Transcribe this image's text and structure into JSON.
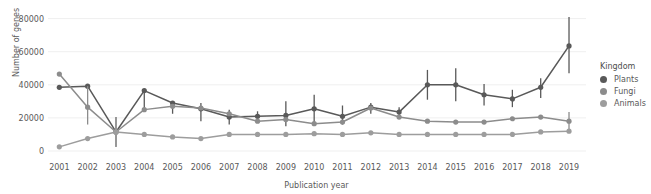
{
  "chart_data": {
    "type": "line",
    "title": "",
    "xlabel": "Publication year",
    "ylabel": "Number of genes",
    "x": [
      2001,
      2002,
      2003,
      2004,
      2005,
      2006,
      2007,
      2008,
      2009,
      2010,
      2011,
      2012,
      2013,
      2014,
      2015,
      2016,
      2017,
      2018,
      2019
    ],
    "xtick_labels": [
      "2001",
      "2002",
      "2003",
      "2004",
      "2005",
      "2006",
      "2007",
      "2008",
      "2009",
      "2010",
      "2011",
      "2012",
      "2013",
      "2014",
      "2015",
      "2016",
      "2017",
      "2018",
      "2019"
    ],
    "ytick_labels": [
      "0",
      "20000",
      "40000",
      "60000",
      "80000"
    ],
    "ytick_values": [
      0,
      20000,
      40000,
      60000,
      80000
    ],
    "ylim": [
      0,
      84000
    ],
    "xlim": [
      2000.6,
      2019.6
    ],
    "grid": "horizontal",
    "legend_position": "right",
    "legend_title": "Kingdom",
    "series": [
      {
        "name": "Plants",
        "color": "#595959",
        "values": [
          38500,
          39200,
          11500,
          36500,
          29000,
          25500,
          20500,
          21000,
          21500,
          25500,
          21000,
          26500,
          23500,
          40000,
          40000,
          34000,
          31500,
          38500,
          63500
        ],
        "err_low": [
          38500,
          39200,
          2500,
          24000,
          22500,
          18000,
          16000,
          18000,
          15000,
          16500,
          16000,
          22500,
          20500,
          31000,
          30000,
          27500,
          26500,
          32000,
          47000
        ],
        "err_high": [
          38500,
          39200,
          20500,
          36500,
          29000,
          29000,
          25000,
          24000,
          30000,
          34000,
          27500,
          29000,
          26500,
          49000,
          50000,
          40500,
          37000,
          44000,
          81000
        ]
      },
      {
        "name": "Fungi",
        "color": "#8c8c8c",
        "values": [
          46500,
          26500,
          11500,
          25000,
          27000,
          26000,
          22500,
          18000,
          19000,
          16500,
          17500,
          26000,
          20500,
          18000,
          17500,
          17500,
          19500,
          20500,
          18000
        ],
        "err_low": [
          46500,
          16000,
          2500,
          25000,
          27000,
          26000,
          22500,
          18000,
          19000,
          16500,
          17500,
          26000,
          20500,
          18000,
          17500,
          17500,
          19500,
          20500,
          12500
        ],
        "err_high": [
          46500,
          39200,
          20500,
          25000,
          27000,
          26000,
          22500,
          18000,
          19000,
          16500,
          17500,
          26000,
          20500,
          18000,
          17500,
          17500,
          19500,
          20500,
          23500
        ]
      },
      {
        "name": "Animals",
        "color": "#9d9d9d",
        "values": [
          2500,
          7500,
          11500,
          10000,
          8500,
          7500,
          10000,
          10000,
          10000,
          10500,
          10000,
          11000,
          10000,
          10000,
          10000,
          10000,
          10000,
          11500,
          12000
        ],
        "err_low": [
          2500,
          7500,
          2500,
          10000,
          8500,
          7500,
          10000,
          10000,
          10000,
          10500,
          10000,
          11000,
          10000,
          10000,
          10000,
          10000,
          10000,
          11500,
          12000
        ],
        "err_high": [
          2500,
          7500,
          20500,
          10000,
          8500,
          7500,
          10000,
          10000,
          10000,
          10500,
          10000,
          11000,
          10000,
          10000,
          10000,
          10000,
          10000,
          11500,
          12000
        ]
      }
    ]
  },
  "legend": {
    "title": "Kingdom",
    "items": [
      {
        "label": "Plants",
        "color": "#595959"
      },
      {
        "label": "Fungi",
        "color": "#8c8c8c"
      },
      {
        "label": "Animals",
        "color": "#9d9d9d"
      }
    ]
  },
  "axes": {
    "x_title": "Publication year",
    "y_title": "Number of genes"
  },
  "colors": {
    "background": "#ffffff",
    "grid": "#efefef",
    "text": "#595959"
  }
}
